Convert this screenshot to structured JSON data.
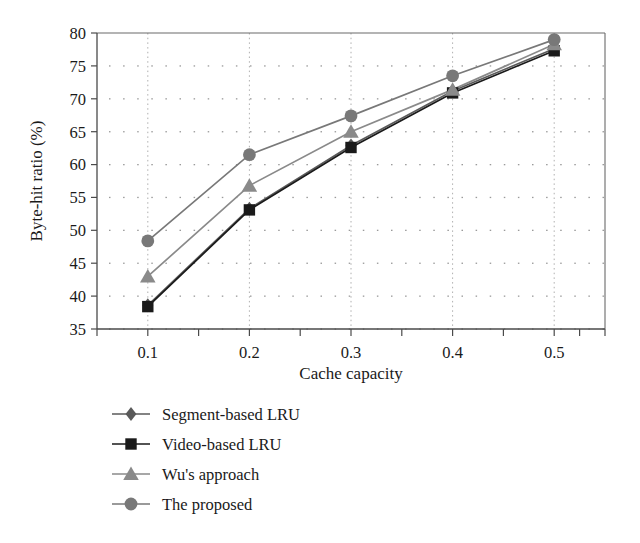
{
  "chart_data": {
    "type": "line",
    "title": "",
    "subtitle": "",
    "xlabel": "Cache capacity",
    "ylabel": "Byte-hit ratio (%)",
    "x": [
      0.1,
      0.2,
      0.3,
      0.4,
      0.5
    ],
    "categories": [
      "0.1",
      "0.2",
      "0.3",
      "0.4",
      "0.5"
    ],
    "xtick_labels": [
      "0.1",
      "0.2",
      "0.3",
      "0.4",
      "0.5"
    ],
    "ytick_labels": [
      "35",
      "40",
      "45",
      "50",
      "55",
      "60",
      "65",
      "70",
      "75",
      "80"
    ],
    "xlim": [
      0.05,
      0.55
    ],
    "ylim": [
      35,
      80
    ],
    "grid": "dotted",
    "legend_position": "below-plot-left",
    "series": [
      {
        "name": "Segment-based LRU",
        "marker": "diamond",
        "color": "#5a5a5a",
        "values": [
          38.6,
          53.3,
          62.9,
          71.2,
          77.6
        ]
      },
      {
        "name": "Video-based LRU",
        "marker": "square",
        "color": "#1a1a1a",
        "values": [
          38.4,
          53.1,
          62.6,
          70.9,
          77.3
        ]
      },
      {
        "name": "Wu's approach",
        "marker": "triangle",
        "color": "#8a8a8a",
        "values": [
          43.0,
          56.8,
          65.0,
          71.4,
          78.3
        ]
      },
      {
        "name": "The proposed",
        "marker": "circle",
        "color": "#787878",
        "values": [
          48.4,
          61.5,
          67.4,
          73.5,
          79.0
        ]
      }
    ]
  },
  "legend": {
    "items": [
      {
        "label": "Segment-based LRU",
        "marker": "diamond",
        "color": "#5a5a5a"
      },
      {
        "label": "Video-based LRU",
        "marker": "square",
        "color": "#1a1a1a"
      },
      {
        "label": "Wu's approach",
        "marker": "triangle",
        "color": "#8a8a8a"
      },
      {
        "label": "The proposed",
        "marker": "circle",
        "color": "#787878"
      }
    ]
  }
}
